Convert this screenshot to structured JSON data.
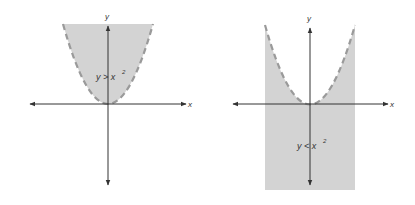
{
  "figures": [
    {
      "id": "left",
      "inequality": "y > x²",
      "inequality_main": "y > x",
      "exponent": "2",
      "x_axis_label": "x",
      "y_axis_label": "y",
      "shading": "above curve (inside parabola)",
      "boundary": "dashed parabola y = x²"
    },
    {
      "id": "right",
      "inequality": "y < x²",
      "inequality_main": "y < x",
      "exponent": "2",
      "x_axis_label": "x",
      "y_axis_label": "y",
      "shading": "below curve (outside parabola)",
      "boundary": "dashed parabola y = x²"
    }
  ],
  "colors": {
    "shade": "#d3d3d3",
    "curve": "#9a9a9a",
    "axis": "#333333",
    "background": "#ffffff"
  }
}
